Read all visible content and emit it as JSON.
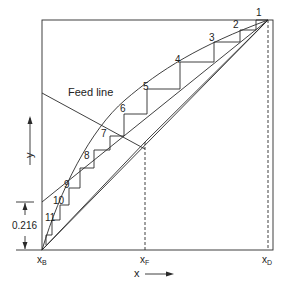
{
  "diagram": {
    "feed_line_label": "Feed line",
    "x_axis_label": "x",
    "y_axis_label": "y",
    "x_markers": [
      {
        "label": "x",
        "sub": "B"
      },
      {
        "label": "x",
        "sub": "F"
      },
      {
        "label": "x",
        "sub": "D"
      }
    ],
    "intercept_label": "0.216",
    "stage_labels": [
      "1",
      "2",
      "3",
      "4",
      "5",
      "6",
      "7",
      "8",
      "9",
      "10",
      "11"
    ],
    "colors": {
      "line": "#2a2a2a",
      "background": "#ffffff"
    }
  }
}
